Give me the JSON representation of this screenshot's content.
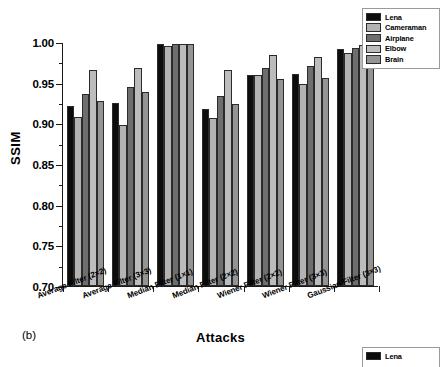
{
  "figure": {
    "panel_label": "(b)"
  },
  "legend": {
    "position": "top-right",
    "entries": [
      {
        "label": "Lena",
        "color": "#0d0d0d"
      },
      {
        "label": "Cameraman",
        "color": "#b3b3b3"
      },
      {
        "label": "Airplane",
        "color": "#6e6e6e"
      },
      {
        "label": "Elbow",
        "color": "#bcbcbc"
      },
      {
        "label": "Brain",
        "color": "#949494"
      }
    ]
  },
  "legend_secondary": {
    "entries": [
      {
        "label": "Lena",
        "color": "#0d0d0d"
      }
    ]
  },
  "axes": {
    "y_ticks": [
      "0.70",
      "0.75",
      "0.80",
      "0.85",
      "0.90",
      "0.95",
      "1.00"
    ],
    "x_tick_count": 8
  },
  "chart_data": {
    "type": "bar",
    "title": "",
    "xlabel": "Attacks",
    "ylabel": "SSIM",
    "ylim": [
      0.7,
      1.0
    ],
    "ytick_step": 0.05,
    "grid": false,
    "legend_position": "top-right",
    "categories": [
      "Average Filter (2×2)",
      "Average Filter (3×3)",
      "Median Filter (1×1)",
      "Median Filter (2×2)",
      "Wiener Filter (2×2)",
      "Wiener Filter (3×3)",
      "Gaussian Filter (3×3)"
    ],
    "series": [
      {
        "name": "Lena",
        "color": "#0d0d0d",
        "values": [
          0.921,
          0.925,
          0.998,
          0.918,
          0.96,
          0.961,
          0.992
        ]
      },
      {
        "name": "Cameraman",
        "color": "#b3b3b3",
        "values": [
          0.908,
          0.898,
          0.995,
          0.907,
          0.959,
          0.948,
          0.987
        ]
      },
      {
        "name": "Airplane",
        "color": "#6e6e6e",
        "values": [
          0.936,
          0.945,
          0.998,
          0.934,
          0.968,
          0.971,
          0.993
        ]
      },
      {
        "name": "Elbow",
        "color": "#bcbcbc",
        "values": [
          0.966,
          0.968,
          0.998,
          0.965,
          0.984,
          0.982,
          0.996
        ]
      },
      {
        "name": "Brain",
        "color": "#949494",
        "values": [
          0.927,
          0.939,
          0.998,
          0.924,
          0.955,
          0.956,
          0.991
        ]
      }
    ]
  }
}
